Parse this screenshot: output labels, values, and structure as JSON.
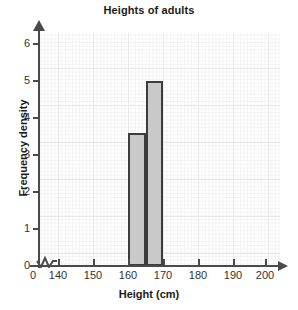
{
  "chart_data": {
    "type": "bar",
    "title": "Heights of adults",
    "xlabel": "Height (cm)",
    "ylabel": "Frequency density",
    "xlim": [
      140,
      200
    ],
    "ylim": [
      0,
      6
    ],
    "grid": true,
    "legend": null,
    "axis_break": {
      "present": true,
      "between": [
        0,
        140
      ],
      "symbol": "zigzag"
    },
    "x_ticks": [
      {
        "label": "0",
        "value": 0
      },
      {
        "label": "140",
        "value": 140
      },
      {
        "label": "150",
        "value": 150
      },
      {
        "label": "160",
        "value": 160
      },
      {
        "label": "170",
        "value": 170
      },
      {
        "label": "180",
        "value": 180
      },
      {
        "label": "190",
        "value": 190
      },
      {
        "label": "200",
        "value": 200
      }
    ],
    "y_ticks": [
      {
        "label": "0",
        "value": 0
      },
      {
        "label": "1",
        "value": 1
      },
      {
        "label": "2",
        "value": 2
      },
      {
        "label": "3",
        "value": 3
      },
      {
        "label": "4",
        "value": 4
      },
      {
        "label": "5",
        "value": 5
      },
      {
        "label": "6",
        "value": 6
      }
    ],
    "bars": [
      {
        "label": "160-165",
        "x_start": 160,
        "x_end": 165,
        "value": 3.6
      },
      {
        "label": "165-170",
        "x_start": 165,
        "x_end": 170,
        "value": 5.0
      }
    ],
    "categories": [
      "160-165",
      "165-170"
    ],
    "values": [
      3.6,
      5.0
    ],
    "colors": {
      "bar_fill": "#c9c9c9",
      "bar_stroke": "#3d3d3d",
      "axis": "#4a4a4a",
      "grid_major": "#e8e8e8",
      "grid_minor": "#f3f3f3",
      "text": "#1a1a1a"
    }
  }
}
